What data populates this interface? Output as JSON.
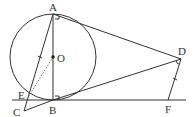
{
  "figure": {
    "type": "geometry",
    "circle": {
      "center": "O",
      "diameter": "AB"
    },
    "points": {
      "A": {
        "label": "A",
        "x": 53,
        "y": 14
      },
      "B": {
        "label": "B",
        "x": 53,
        "y": 100
      },
      "O": {
        "label": "O",
        "x": 53,
        "y": 57
      },
      "C": {
        "label": "C",
        "x": 24,
        "y": 111
      },
      "D": {
        "label": "D",
        "x": 181,
        "y": 59
      },
      "E": {
        "label": "E",
        "x": 27,
        "y": 99
      },
      "F": {
        "label": "F",
        "x": 168,
        "y": 100
      }
    },
    "segments": [
      "AB",
      "AC",
      "AD",
      "BD",
      "BC",
      "DF",
      "OE (dashed)",
      "line BF"
    ],
    "marks": [
      "right angle at A",
      "right angle at B",
      "tick on AC",
      "tick on DF",
      "angle mark at D"
    ]
  }
}
